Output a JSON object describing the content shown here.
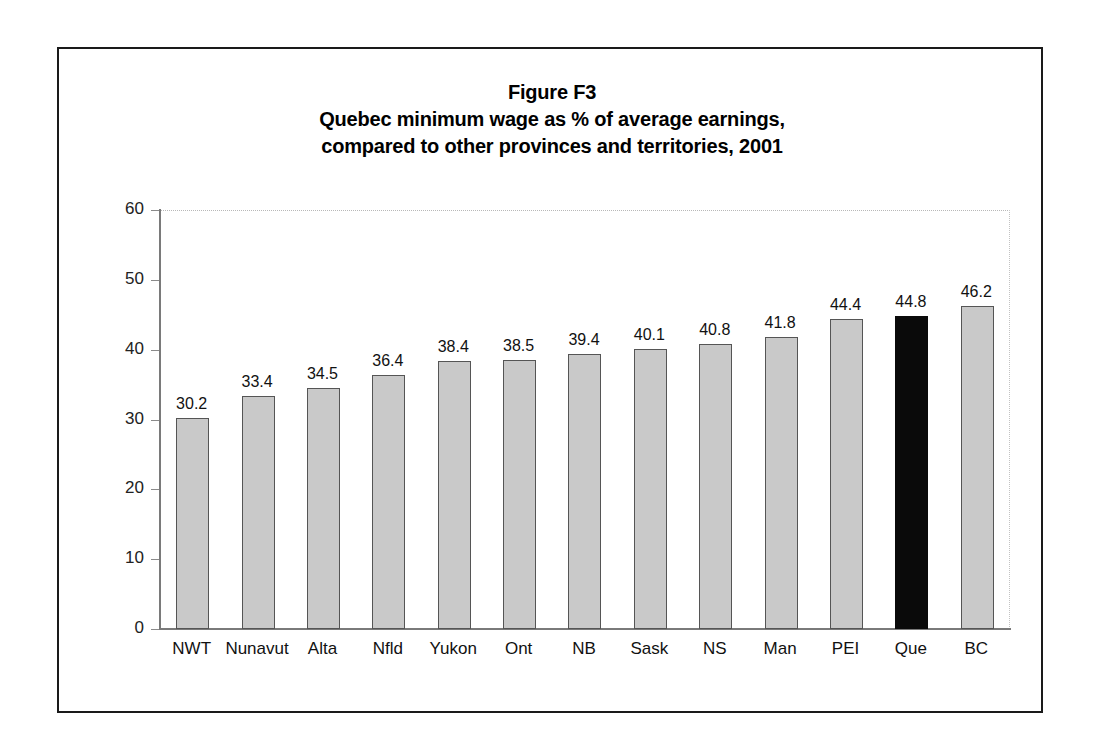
{
  "figure": {
    "title_lines": [
      "Figure F3",
      "Quebec minimum wage as % of average earnings,",
      "compared to other provinces and territories, 2001"
    ]
  },
  "chart_data": {
    "type": "bar",
    "xlabel": "",
    "ylabel": "",
    "ylim": [
      0,
      60
    ],
    "yticks": [
      0,
      10,
      20,
      30,
      40,
      50,
      60
    ],
    "grid": false,
    "legend": null,
    "categories": [
      "NWT",
      "Nunavut",
      "Alta",
      "Nfld",
      "Yukon",
      "Ont",
      "NB",
      "Sask",
      "NS",
      "Man",
      "PEI",
      "Que",
      "BC"
    ],
    "values": [
      30.2,
      33.4,
      34.5,
      36.4,
      38.4,
      38.5,
      39.4,
      40.1,
      40.8,
      41.8,
      44.4,
      44.8,
      46.2
    ],
    "value_labels": [
      "30.2",
      "33.4",
      "34.5",
      "36.4",
      "38.4",
      "38.5",
      "39.4",
      "40.1",
      "40.8",
      "41.8",
      "44.4",
      "44.8",
      "46.2"
    ],
    "highlight_category": "Que",
    "colors": {
      "bar_fill": "#c9c9c9",
      "bar_edge": "#555555",
      "highlight_fill": "#0a0a0a",
      "frame": "#1a1a1a",
      "axis": "#7a7a7a",
      "text": "#111111",
      "background": "#ffffff"
    }
  }
}
